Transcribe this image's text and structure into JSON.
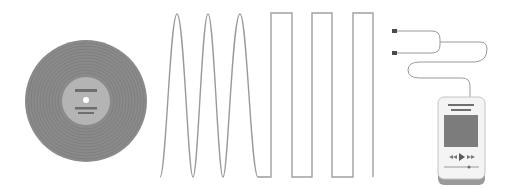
{
  "illustration": {
    "title": "Analog to digital music illustration",
    "elements": [
      {
        "name": "vinyl-record",
        "label": ""
      },
      {
        "name": "analog-sine-wave",
        "label": ""
      },
      {
        "name": "digital-square-wave",
        "label": ""
      },
      {
        "name": "earphones",
        "label": ""
      },
      {
        "name": "mp3-player",
        "label": ""
      }
    ],
    "colors": {
      "background": "#ffffff",
      "record": "#8a8a8a",
      "record_groove": "#7a7a7a",
      "label": "#b4b4b4",
      "label_lines": "#6e6e6e",
      "wave": "#9a9a9a",
      "player_body": "#f4f4f4",
      "player_screen": "#7c7c7c",
      "player_base": "#9a9a9a"
    },
    "wave": {
      "sine_cycles": 3,
      "square_cycles": 3
    },
    "player": {
      "controls": [
        "rewind-icon",
        "play-icon",
        "fast-forward-icon"
      ]
    }
  }
}
